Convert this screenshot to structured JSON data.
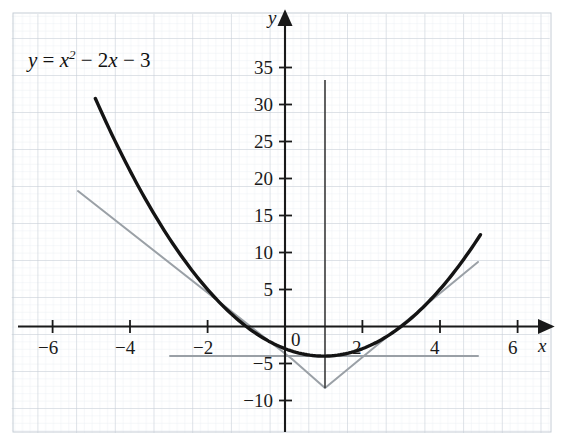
{
  "figure": {
    "equation_label": "y = x² − 2x − 3",
    "equation_parts": {
      "y": "y",
      "equals": " = ",
      "x": "x",
      "exponent": "2",
      "rest": " − 2",
      "x2": "x",
      "tail": " − 3"
    },
    "background_color": "#ffffff",
    "grid_color": "#c8cfd8",
    "grid_minor_color": "#e2e7ee",
    "curve_color": "#141414",
    "line_color": "#9aa0a6",
    "axis_color": "#1a1a1a"
  },
  "axes": {
    "x_name": "x",
    "y_name": "y",
    "origin_label": "0",
    "x_ticks": [
      {
        "value": -6,
        "label": "−6"
      },
      {
        "value": -4,
        "label": "−4"
      },
      {
        "value": -2,
        "label": "−2"
      },
      {
        "value": 2,
        "label": "2"
      },
      {
        "value": 4,
        "label": "4"
      },
      {
        "value": 6,
        "label": "6"
      }
    ],
    "y_ticks": [
      {
        "value": 35,
        "label": "35"
      },
      {
        "value": 30,
        "label": "30"
      },
      {
        "value": 25,
        "label": "25"
      },
      {
        "value": 20,
        "label": "20"
      },
      {
        "value": 15,
        "label": "15"
      },
      {
        "value": 10,
        "label": "10"
      },
      {
        "value": 5,
        "label": "5"
      },
      {
        "value": -5,
        "label": "−5"
      },
      {
        "value": -10,
        "label": "−10"
      }
    ]
  },
  "chart_data": {
    "type": "line",
    "xlabel": "x",
    "ylabel": "y",
    "xlim": [
      -7.3,
      7.2
    ],
    "ylim": [
      -13.5,
      38
    ],
    "grid": true,
    "legend": "none",
    "series": [
      {
        "name": "y = x² − 2x − 3",
        "type": "parabola",
        "color": "#141414",
        "width": 3.4,
        "x_domain": [
          -4.9,
          5.05
        ],
        "coefficients": {
          "a": 1,
          "b": -2,
          "c": -3
        },
        "vertex": [
          1,
          -4
        ],
        "roots": [
          -1,
          3
        ],
        "points": [
          [
            -4.9,
            30.8
          ],
          [
            -4.5,
            26.25
          ],
          [
            -4,
            21
          ],
          [
            -3.5,
            16.25
          ],
          [
            -3,
            12
          ],
          [
            -2.5,
            8.25
          ],
          [
            -2,
            5
          ],
          [
            -1.5,
            2.25
          ],
          [
            -1,
            0
          ],
          [
            -0.5,
            -1.75
          ],
          [
            0,
            -3
          ],
          [
            0.5,
            -3.75
          ],
          [
            1,
            -4
          ],
          [
            1.5,
            -3.75
          ],
          [
            2,
            -3
          ],
          [
            2.5,
            -1.75
          ],
          [
            3,
            0
          ],
          [
            3.5,
            2.25
          ],
          [
            4,
            5
          ],
          [
            4.5,
            8.25
          ],
          [
            5.05,
            12.4
          ]
        ]
      },
      {
        "name": "chord-left",
        "type": "segment",
        "color": "#9aa0a6",
        "width": 2,
        "from": [
          -5.3,
          18.3
        ],
        "to": [
          0.2,
          -4.5
        ]
      },
      {
        "name": "chord-right",
        "type": "segment",
        "color": "#9aa0a6",
        "width": 2,
        "from": [
          1.05,
          -8.4
        ],
        "to": [
          5.0,
          8.6
        ]
      },
      {
        "name": "horizontal-line-y-equals-4-negative",
        "type": "segment",
        "color": "#9aa0a6",
        "width": 2,
        "from": [
          -2.95,
          -4.05
        ],
        "to": [
          5.0,
          -4.05
        ]
      },
      {
        "name": "vertex-drop-left",
        "type": "segment",
        "color": "#9aa0a6",
        "width": 2,
        "from": [
          0.2,
          -4.5
        ],
        "to": [
          1.05,
          -8.4
        ]
      },
      {
        "name": "vertical-line-x-equals-1",
        "type": "segment",
        "color": "#3a3a3a",
        "width": 1.6,
        "from": [
          1.0,
          33.2
        ],
        "to": [
          1.0,
          -8.4
        ]
      }
    ]
  }
}
